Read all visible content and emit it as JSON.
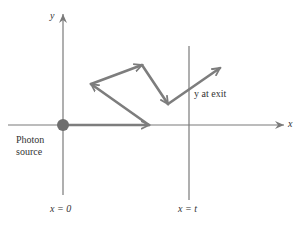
{
  "axes": {
    "y_label": "y",
    "x_label": "x"
  },
  "labels": {
    "photon_source_line1": "Photon",
    "photon_source_line2": "source",
    "y_at_exit": "y at exit",
    "x_zero": "x = 0",
    "x_t": "x = t"
  },
  "colors": {
    "axis": "#7a7a7a",
    "arrow": "#7d7d7d",
    "source_dot": "#6e6e6e",
    "text": "#333333"
  },
  "path": {
    "source": [
      63,
      125
    ],
    "points": [
      [
        63,
        125
      ],
      [
        149,
        125
      ],
      [
        91,
        84
      ],
      [
        142,
        65
      ],
      [
        168,
        104
      ],
      [
        220,
        68
      ]
    ]
  }
}
